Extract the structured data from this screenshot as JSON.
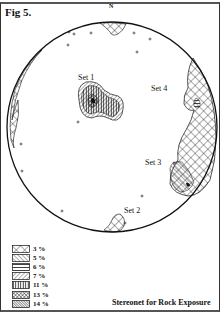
{
  "figure": {
    "title": "Fig 5.",
    "north_label": "N",
    "caption": "Stereonet for Rock Exposure"
  },
  "sets": [
    {
      "label": "Set 1"
    },
    {
      "label": "Set 2"
    },
    {
      "label": "Set 3"
    },
    {
      "label": "Set 4"
    }
  ],
  "legend": {
    "items": [
      {
        "label": "3 %",
        "pattern": "crosshatch-coarse"
      },
      {
        "label": "5 %",
        "pattern": "diagonal-back"
      },
      {
        "label": "6 %",
        "pattern": "horizontal"
      },
      {
        "label": "7 %",
        "pattern": "diagonal-fwd"
      },
      {
        "label": "11 %",
        "pattern": "vertical"
      },
      {
        "label": "13 %",
        "pattern": "crosshatch-fine"
      },
      {
        "label": "14 %",
        "pattern": "diagonal-dense"
      }
    ]
  },
  "colors": {
    "ink": "#111111",
    "background": "#ffffff"
  }
}
